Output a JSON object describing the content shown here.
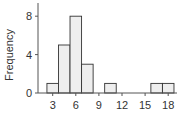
{
  "chart_data": {
    "type": "bar",
    "title": "",
    "xlabel": "",
    "ylabel": "Frequency",
    "bins": [
      {
        "start": 2.25,
        "end": 3.75,
        "count": 1
      },
      {
        "start": 3.75,
        "end": 5.25,
        "count": 5
      },
      {
        "start": 5.25,
        "end": 6.75,
        "count": 8
      },
      {
        "start": 6.75,
        "end": 8.25,
        "count": 3
      },
      {
        "start": 8.25,
        "end": 9.75,
        "count": 0
      },
      {
        "start": 9.75,
        "end": 11.25,
        "count": 1
      },
      {
        "start": 11.25,
        "end": 12.75,
        "count": 0
      },
      {
        "start": 12.75,
        "end": 14.25,
        "count": 0
      },
      {
        "start": 14.25,
        "end": 15.75,
        "count": 0
      },
      {
        "start": 15.75,
        "end": 17.25,
        "count": 1
      },
      {
        "start": 17.25,
        "end": 18.75,
        "count": 1
      }
    ],
    "xticks": [
      3,
      6,
      9,
      12,
      15,
      18
    ],
    "yticks": [
      0,
      4,
      8
    ],
    "xlim": [
      2,
      19
    ],
    "ylim": [
      0,
      9
    ],
    "grid": false,
    "legend": null,
    "colors": {
      "bar_fill": "#eeeeee",
      "bar_stroke": "#333333",
      "axis": "#555555"
    }
  }
}
